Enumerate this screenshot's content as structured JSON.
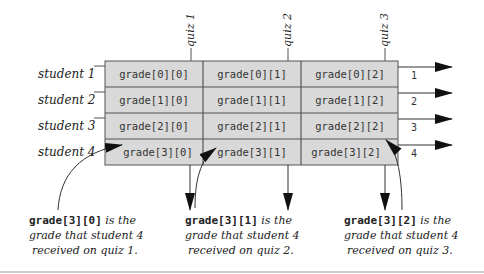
{
  "diagram": {
    "colors": {
      "cell_fill": "#d9d9d9",
      "grid_line": "#555555",
      "text": "#333333",
      "arrow": "#111111",
      "separator": "#bbbbbb"
    },
    "columns": [
      {
        "label": "quiz 1"
      },
      {
        "label": "quiz 2"
      },
      {
        "label": "quiz 3"
      }
    ],
    "rows": [
      {
        "label": "student 1",
        "index_label": "1",
        "cells": [
          "grade[0][0]",
          "grade[0][1]",
          "grade[0][2]"
        ]
      },
      {
        "label": "student 2",
        "index_label": "2",
        "cells": [
          "grade[1][0]",
          "grade[1][1]",
          "grade[1][2]"
        ]
      },
      {
        "label": "student 3",
        "index_label": "3",
        "cells": [
          "grade[2][0]",
          "grade[2][1]",
          "grade[2][2]"
        ]
      },
      {
        "label": "student 4",
        "index_label": "4",
        "cells": [
          "grade[3][0]",
          "grade[3][1]",
          "grade[3][2]"
        ]
      }
    ],
    "annotations": [
      {
        "code": "grade[3][0]",
        "line1_rest": " is the",
        "line2": "grade that student 4",
        "line3": "received on quiz 1."
      },
      {
        "code": "grade[3][1]",
        "line1_rest": " is the",
        "line2": "grade that student 4",
        "line3": "received on quiz 2."
      },
      {
        "code": "grade[3][2]",
        "line1_rest": " is the",
        "line2": "grade that student 4",
        "line3": "received on quiz 3."
      }
    ]
  }
}
